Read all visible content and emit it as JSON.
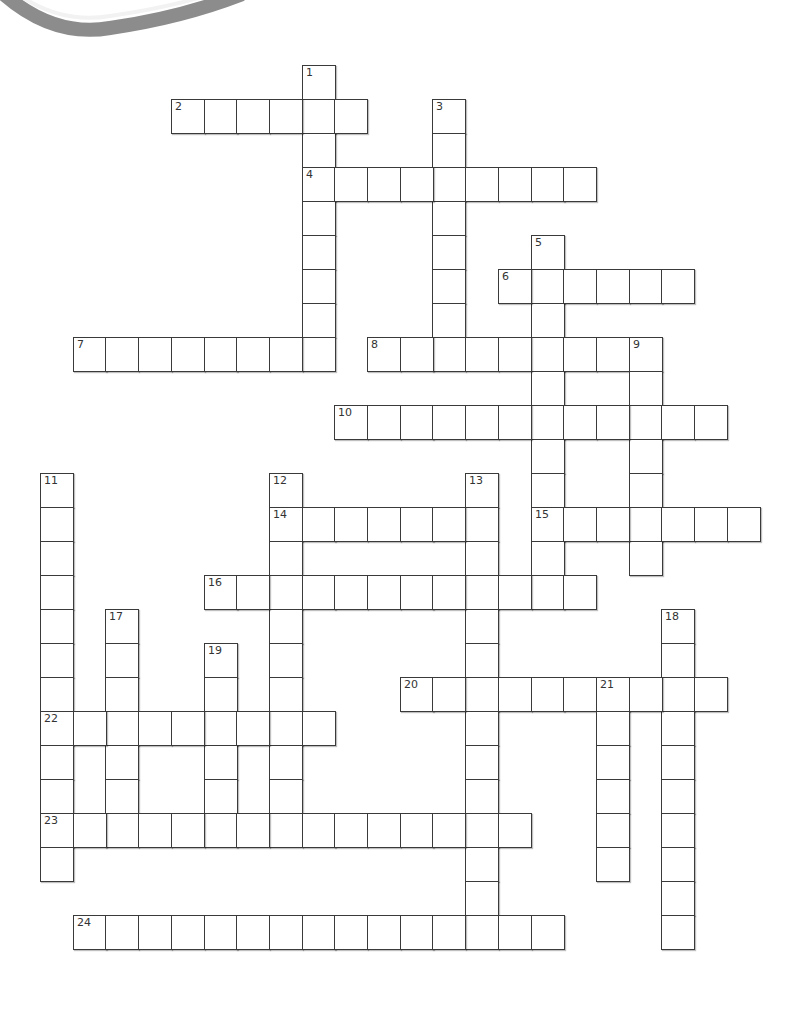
{
  "puzzle": {
    "type": "crossword",
    "grid": {
      "origin_x": 40,
      "origin_y": 65,
      "cell_w": 32.7,
      "cell_h": 34.0,
      "cols": 23,
      "rows": 26
    },
    "colors": {
      "border": "#3a3a3a",
      "arc": "#8c8c8c",
      "background": "#ffffff"
    },
    "entries": [
      {
        "number": "1",
        "direction": "down",
        "col": 8,
        "row": 0,
        "length": 9
      },
      {
        "number": "2",
        "direction": "across",
        "col": 4,
        "row": 1,
        "length": 6
      },
      {
        "number": "3",
        "direction": "down",
        "col": 12,
        "row": 1,
        "length": 8
      },
      {
        "number": "4",
        "direction": "across",
        "col": 8,
        "row": 3,
        "length": 9
      },
      {
        "number": "5",
        "direction": "down",
        "col": 15,
        "row": 5,
        "length": 11
      },
      {
        "number": "6",
        "direction": "across",
        "col": 14,
        "row": 6,
        "length": 6
      },
      {
        "number": "7",
        "direction": "across",
        "col": 1,
        "row": 8,
        "length": 8
      },
      {
        "number": "8",
        "direction": "across",
        "col": 10,
        "row": 8,
        "length": 9
      },
      {
        "number": "9",
        "direction": "down",
        "col": 18,
        "row": 8,
        "length": 7
      },
      {
        "number": "10",
        "direction": "across",
        "col": 9,
        "row": 10,
        "length": 12
      },
      {
        "number": "11",
        "direction": "down",
        "col": 0,
        "row": 12,
        "length": 12
      },
      {
        "number": "12",
        "direction": "down",
        "col": 7,
        "row": 12,
        "length": 11
      },
      {
        "number": "13",
        "direction": "down",
        "col": 13,
        "row": 12,
        "length": 14
      },
      {
        "number": "14",
        "direction": "across",
        "col": 7,
        "row": 13,
        "length": 7
      },
      {
        "number": "15",
        "direction": "across",
        "col": 15,
        "row": 13,
        "length": 7
      },
      {
        "number": "16",
        "direction": "across",
        "col": 5,
        "row": 15,
        "length": 12
      },
      {
        "number": "17",
        "direction": "down",
        "col": 2,
        "row": 16,
        "length": 7
      },
      {
        "number": "18",
        "direction": "down",
        "col": 19,
        "row": 16,
        "length": 10
      },
      {
        "number": "19",
        "direction": "down",
        "col": 5,
        "row": 17,
        "length": 6
      },
      {
        "number": "20",
        "direction": "across",
        "col": 11,
        "row": 18,
        "length": 10
      },
      {
        "number": "21",
        "direction": "down",
        "col": 17,
        "row": 18,
        "length": 6
      },
      {
        "number": "22",
        "direction": "across",
        "col": 0,
        "row": 19,
        "length": 9
      },
      {
        "number": "23",
        "direction": "across",
        "col": 0,
        "row": 22,
        "length": 15
      },
      {
        "number": "24",
        "direction": "across",
        "col": 1,
        "row": 25,
        "length": 15
      }
    ]
  }
}
